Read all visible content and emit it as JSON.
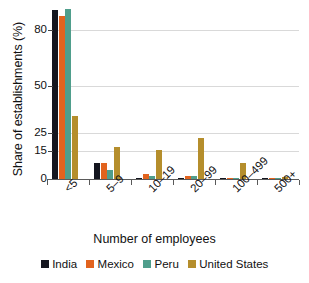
{
  "chart_data": {
    "type": "bar",
    "title": "",
    "xlabel": "Number of employees",
    "ylabel": "Share of establishments (%)",
    "categories": [
      "<5",
      "5–9",
      "10–19",
      "20–99",
      "100–499",
      "500+"
    ],
    "yticks": [
      0,
      15,
      25,
      50,
      80
    ],
    "ylim": [
      0,
      92
    ],
    "grid": "horizontal",
    "legend_position": "bottom",
    "series": [
      {
        "name": "India",
        "color": "#14161f",
        "values": [
          91.0,
          8.5,
          0.8,
          0.7,
          0.2,
          0.05
        ]
      },
      {
        "name": "Mexico",
        "color": "#e2631e",
        "values": [
          87.5,
          8.6,
          2.5,
          1.8,
          0.3,
          0.05
        ]
      },
      {
        "name": "Peru",
        "color": "#4f9e8c",
        "values": [
          91.5,
          5.0,
          1.8,
          1.6,
          0.4,
          0.1
        ]
      },
      {
        "name": "United States",
        "color": "#b58e2c",
        "values": [
          34.0,
          17.0,
          15.5,
          22.0,
          8.5,
          1.0
        ]
      }
    ]
  },
  "axes": {
    "ylabel": "Share of establishments (%)",
    "xlabel": "Number of employees",
    "ytick_labels": [
      "0",
      "15",
      "25",
      "50",
      "80"
    ],
    "xtick_labels": [
      "<5",
      "5–9",
      "10–19",
      "20–99",
      "100–499",
      "500+"
    ]
  },
  "legend": {
    "items": [
      {
        "label": "India",
        "color": "#14161f"
      },
      {
        "label": "Mexico",
        "color": "#e2631e"
      },
      {
        "label": "Peru",
        "color": "#4f9e8c"
      },
      {
        "label": "United States",
        "color": "#b58e2c"
      }
    ]
  }
}
